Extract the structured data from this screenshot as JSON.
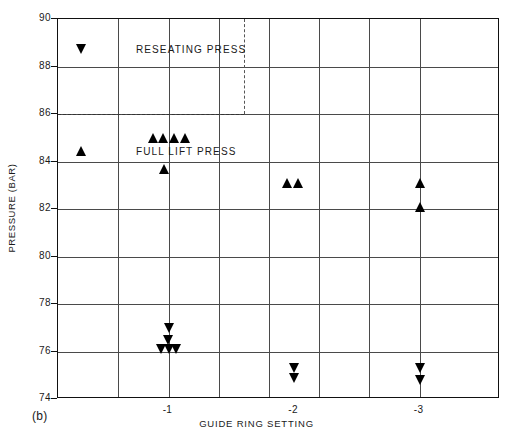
{
  "figure": {
    "panel_tag": "(b)",
    "xlabel": "GUIDE RING SETTING",
    "ylabel": "PRESSURE (BAR)"
  },
  "legend": {
    "items": [
      {
        "symbol": "down-triangle",
        "label": "RESEATING PRESS"
      },
      {
        "symbol": "up-triangle",
        "label": "FULL LIFT PRESS"
      }
    ]
  },
  "axes": {
    "y_ticks": [
      "90",
      "88",
      "86",
      "84",
      "82",
      "80",
      "78",
      "76",
      "74"
    ],
    "x_ticks": [
      "-1",
      "-2",
      "-3"
    ]
  },
  "chart_data": {
    "type": "scatter",
    "title": "",
    "xlabel": "GUIDE RING SETTING",
    "ylabel": "PRESSURE (BAR)",
    "xlim": [
      -0.3,
      -3.6
    ],
    "ylim": [
      74,
      90
    ],
    "y_ticks": [
      74,
      76,
      78,
      80,
      82,
      84,
      86,
      88,
      90
    ],
    "x_ticks": [
      -1,
      -2,
      -3
    ],
    "grid": true,
    "legend_position": "inside-upper-left",
    "reference_lines": [
      {
        "orientation": "horizontal",
        "value": 86,
        "style": "dash-dot",
        "extent": "left-to-x--1.5"
      },
      {
        "orientation": "vertical",
        "value": -1.5,
        "style": "dash-dot",
        "extent": "top-to-y-86"
      }
    ],
    "series": [
      {
        "name": "FULL LIFT PRESS",
        "marker": "up-triangle",
        "points": [
          {
            "x": -1.0,
            "y": 85.0
          },
          {
            "x": -1.0,
            "y": 85.0
          },
          {
            "x": -1.0,
            "y": 85.0
          },
          {
            "x": -1.0,
            "y": 85.0
          },
          {
            "x": -1.0,
            "y": 83.7
          },
          {
            "x": -2.0,
            "y": 83.1
          },
          {
            "x": -2.0,
            "y": 83.1
          },
          {
            "x": -3.0,
            "y": 83.1
          },
          {
            "x": -3.0,
            "y": 82.1
          }
        ]
      },
      {
        "name": "RESEATING PRESS",
        "marker": "down-triangle",
        "points": [
          {
            "x": -1.0,
            "y": 77.0
          },
          {
            "x": -1.0,
            "y": 76.5
          },
          {
            "x": -1.0,
            "y": 76.1
          },
          {
            "x": -1.0,
            "y": 76.1
          },
          {
            "x": -1.0,
            "y": 76.1
          },
          {
            "x": -2.0,
            "y": 75.3
          },
          {
            "x": -2.0,
            "y": 74.9
          },
          {
            "x": -3.0,
            "y": 75.3
          },
          {
            "x": -3.0,
            "y": 74.8
          }
        ]
      }
    ]
  }
}
